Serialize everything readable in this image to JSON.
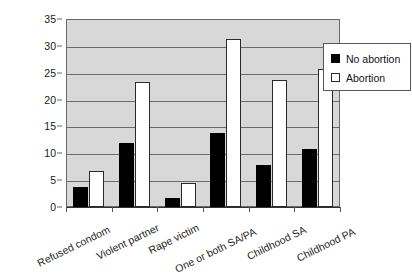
{
  "chart_data": {
    "type": "bar",
    "title": "",
    "subtitle": "",
    "xlabel": "",
    "ylabel": "",
    "ylim": [
      0,
      35
    ],
    "ytick_step": 5,
    "yticks": [
      "0",
      "5",
      "10",
      "15",
      "20",
      "25",
      "30",
      "35"
    ],
    "grid": true,
    "legend_position": "right",
    "categories": [
      "Refused condom",
      "Violent partner",
      "Rape victim",
      "One or both SA/PA",
      "Childhood SA",
      "Childhood PA"
    ],
    "series": [
      {
        "name": "No abortion",
        "color": "#000000",
        "values": [
          3.7,
          11.9,
          1.7,
          13.7,
          7.9,
          10.8
        ]
      },
      {
        "name": "Abortion",
        "color": "#ffffff",
        "values": [
          6.7,
          23.3,
          4.4,
          31.2,
          23.6,
          25.7
        ]
      }
    ]
  },
  "legend": {
    "entries": [
      {
        "label": "No abortion",
        "swatch": "filled-square-icon"
      },
      {
        "label": "Abortion",
        "swatch": "hollow-square-icon"
      }
    ]
  },
  "colors": {
    "plot_background": "#d8d8d8",
    "gridline": "#6a6a6a",
    "axis": "#333333",
    "text": "#1a1a1a"
  }
}
